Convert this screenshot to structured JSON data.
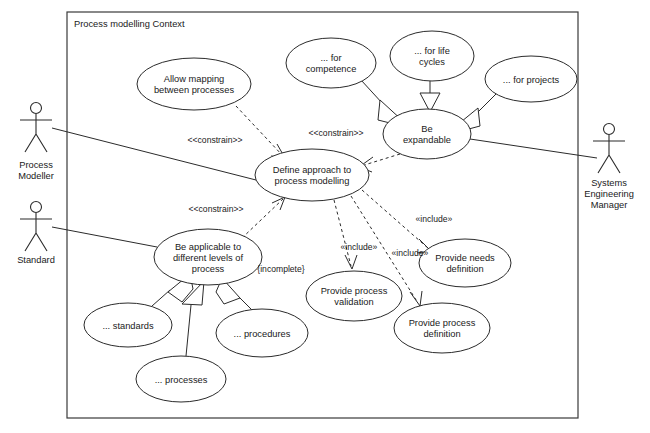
{
  "diagram": {
    "kind": "uml-use-case-diagram",
    "boundary": {
      "title": "Process modelling Context",
      "x": 67,
      "y": 12,
      "width": 511,
      "height": 406
    },
    "colors": {
      "stroke": "#2b2b2b",
      "fill": "#ffffff",
      "text": "#1a1a1a",
      "boundary_stroke": "#3a3a3a"
    },
    "use_cases": [
      {
        "id": "allow-mapping",
        "lines": [
          "Allow mapping",
          "between processes"
        ],
        "cx": 194,
        "cy": 84,
        "rx": 57,
        "ry": 26
      },
      {
        "id": "for-competence",
        "lines": [
          "... for",
          "competence"
        ],
        "cx": 331,
        "cy": 63,
        "rx": 45,
        "ry": 25
      },
      {
        "id": "for-life-cycles",
        "lines": [
          "... for life",
          "cycles"
        ],
        "cx": 432,
        "cy": 56,
        "rx": 42,
        "ry": 25
      },
      {
        "id": "for-projects",
        "lines": [
          "... for projects"
        ],
        "cx": 531,
        "cy": 79,
        "rx": 46,
        "ry": 23
      },
      {
        "id": "be-expandable",
        "lines": [
          "Be",
          "expandable"
        ],
        "cx": 427,
        "cy": 134,
        "rx": 44,
        "ry": 25
      },
      {
        "id": "define-approach",
        "lines": [
          "Define approach to",
          "process modelling"
        ],
        "cx": 312,
        "cy": 175,
        "rx": 57,
        "ry": 26
      },
      {
        "id": "be-applicable",
        "lines": [
          "Be applicable to",
          "different levels of",
          "process"
        ],
        "cx": 208,
        "cy": 257,
        "rx": 54,
        "ry": 28
      },
      {
        "id": "standards",
        "lines": [
          "... standards"
        ],
        "cx": 128,
        "cy": 325,
        "rx": 44,
        "ry": 22
      },
      {
        "id": "processes",
        "lines": [
          "... processes"
        ],
        "cx": 181,
        "cy": 379,
        "rx": 45,
        "ry": 23
      },
      {
        "id": "procedures",
        "lines": [
          "... procedures"
        ],
        "cx": 262,
        "cy": 333,
        "rx": 46,
        "ry": 24
      },
      {
        "id": "provide-process-validation",
        "lines": [
          "Provide process",
          "validation"
        ],
        "cx": 354,
        "cy": 296,
        "rx": 48,
        "ry": 25
      },
      {
        "id": "provide-needs-definition",
        "lines": [
          "Provide needs",
          "definition"
        ],
        "cx": 465,
        "cy": 263,
        "rx": 46,
        "ry": 24
      },
      {
        "id": "provide-process-definition",
        "lines": [
          "Provide process",
          "definition"
        ],
        "cx": 442,
        "cy": 328,
        "rx": 48,
        "ry": 25
      }
    ],
    "actors": [
      {
        "id": "process-modeller",
        "lines": [
          "Process",
          "Modeller"
        ],
        "x": 36,
        "y": 108,
        "label_y": 168
      },
      {
        "id": "standard",
        "lines": [
          "Standard"
        ],
        "x": 36,
        "y": 207,
        "label_y": 263
      },
      {
        "id": "systems-engineering-manager",
        "lines": [
          "Systems",
          "Engineering",
          "Manager"
        ],
        "x": 609,
        "y": 129,
        "label_y": 186
      }
    ],
    "edge_labels": [
      {
        "id": "constrain-allow-mapping",
        "text": "<<constrain>>",
        "x": 215,
        "y": 143
      },
      {
        "id": "constrain-be-expandable",
        "text": "<<constrain>>",
        "x": 336,
        "y": 136
      },
      {
        "id": "constrain-be-applicable",
        "text": "<<constrain>>",
        "x": 216,
        "y": 212
      },
      {
        "id": "include-process-validation",
        "text": "«include»",
        "x": 359,
        "y": 250
      },
      {
        "id": "include-process-definition",
        "text": "«include»",
        "x": 410,
        "y": 256
      },
      {
        "id": "include-needs-definition",
        "text": "«include»",
        "x": 434,
        "y": 222
      },
      {
        "id": "incomplete-constraint",
        "text": "{incomplete}",
        "x": 281,
        "y": 272
      }
    ]
  }
}
